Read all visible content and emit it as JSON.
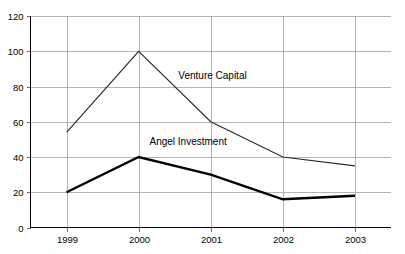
{
  "chart_data": {
    "type": "line",
    "title": "",
    "subtitle": "",
    "xlabel": "",
    "ylabel": "",
    "categories": [
      "1999",
      "2000",
      "2001",
      "2002",
      "2003"
    ],
    "x": [
      1999,
      2000,
      2001,
      2002,
      2003
    ],
    "ylim": [
      0,
      120
    ],
    "yticks": [
      0,
      20,
      40,
      60,
      80,
      100,
      120
    ],
    "ytick_labels": [
      "0",
      "20",
      "40",
      "60",
      "80",
      "100",
      "120"
    ],
    "xtick_labels": [
      "1999",
      "2000",
      "2001",
      "2002",
      "2003"
    ],
    "grid": "both",
    "legend_position": "inline-annotations",
    "series": [
      {
        "name": "Venture Capital",
        "values": [
          54,
          100,
          60,
          40,
          35
        ],
        "line_weight": "thin",
        "color": "#2b2b2b",
        "label_text": "Venture Capital",
        "label_x": 2000.55,
        "label_y": 84
      },
      {
        "name": "Angel Investment",
        "values": [
          20,
          40,
          30,
          16,
          18
        ],
        "line_weight": "thick",
        "color": "#000000",
        "label_text": "Angel Investment",
        "label_x": 2000.15,
        "label_y": 47
      }
    ],
    "annotations": [
      {
        "text": "Venture Capital",
        "series": "Venture Capital"
      },
      {
        "text": "Angel Investment",
        "series": "Angel Investment"
      }
    ],
    "colors": {
      "background": "#ffffff",
      "axis": "#000000",
      "gridline": "#a8a8a8",
      "venture_capital": "#2b2b2b",
      "angel_investment": "#000000",
      "text": "#000000"
    }
  }
}
